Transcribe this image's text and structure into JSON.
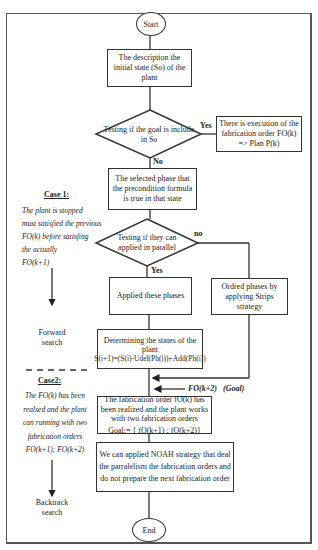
{
  "flowchart": {
    "start": "Start",
    "end": "End",
    "initial_state": "The description the initial state (So) of the plant",
    "decision_goal": {
      "line1": "Testing if the goal is include",
      "line2": "in So"
    },
    "yes1": "Yes",
    "no1": "No",
    "execution_box": "There is execution of the fabrication order FO(k) => Plan P(k)",
    "selected_phase": "The selected phase that the precondition formula is true in that state",
    "decision_parallel": {
      "line1": "Testing if they can",
      "line2": "applied in parallel"
    },
    "no2": "no",
    "yes2": "Yes",
    "applied_phases": "Applied these phases",
    "ordered_phases": "Ordred phases by applying Strips strategy",
    "determining": {
      "line1": "Determining the states of the",
      "line2": "plant",
      "line3": "S(i+1)=(S(i)-Udel(Ph(i))+Add(Ph(i))"
    },
    "goal_input": "FO(k+2)   (Goal)",
    "fabrication_realized": {
      "line1": "The fabrication order fO(k) has been realized and the plant works with two fabrication orders",
      "line2": "Goal:= { fO(k+1) ; fO(k+2)}"
    },
    "noah": "We can applied NOAH strategy that deal the parralelism the fabrication orders and do not prepare the next fabrication order"
  },
  "side_panel": {
    "case1_title": "Case 1:",
    "case1_lines": [
      "The plant is stopped",
      "must satisfied the  previous",
      "FO(k) before satisfing",
      "the actually",
      "FO(k+1)"
    ],
    "forward_label": {
      "line1": "Forward",
      "line2": "search"
    },
    "case2_title": "Case2:",
    "case2_lines": [
      "The FO(k) has been",
      "realsed and the plant",
      "can running with two",
      "fabrication orders",
      "FO(k+1); FO(k+2)"
    ],
    "backtrack_label": {
      "line1": "Backtrack",
      "line2": "search"
    }
  }
}
